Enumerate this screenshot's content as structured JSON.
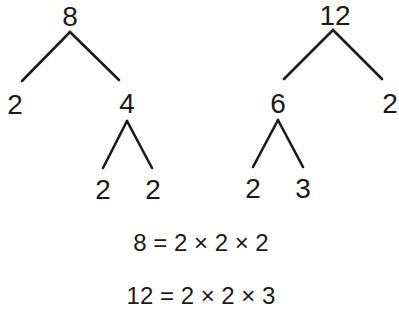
{
  "trees": [
    {
      "root": "8",
      "level1": [
        "2",
        "4"
      ],
      "level2": [
        "2",
        "2"
      ]
    },
    {
      "root": "12",
      "level1": [
        "6",
        "2"
      ],
      "level2": [
        "2",
        "3"
      ]
    }
  ],
  "equations": [
    "8 = 2 × 2 × 2",
    "12 = 2 × 2 × 3"
  ]
}
